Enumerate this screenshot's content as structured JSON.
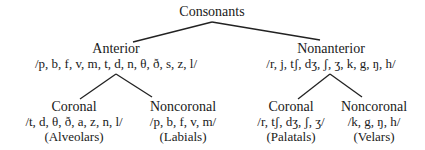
{
  "tree": {
    "root": {
      "label": "Consonants"
    },
    "anterior": {
      "label": "Anterior",
      "set": "/p, b, f, v, m, t, d, n, θ, ð, s, z, l/",
      "coronal": {
        "label": "Coronal",
        "set": "/t, d, θ, ð, a, z, n, l/",
        "group": "(Alveolars)"
      },
      "noncoronal": {
        "label": "Noncoronal",
        "set": "/p, b, f, v, m/",
        "group": "(Labials)"
      }
    },
    "nonanterior": {
      "label": "Nonanterior",
      "set": "/r, j, tʃ, dʒ, ʃ, ʒ, k, g, ŋ, h/",
      "coronal": {
        "label": "Coronal",
        "set": "/r, tʃ, dʒ, ʃ, ʒ/",
        "group": "(Palatals)"
      },
      "noncoronal": {
        "label": "Noncoronal",
        "set": "/k, g, ŋ, h/",
        "group": "(Velars)"
      }
    }
  },
  "colors": {
    "line": "#222222",
    "text": "#1a1a1a",
    "background": "#ffffff"
  }
}
